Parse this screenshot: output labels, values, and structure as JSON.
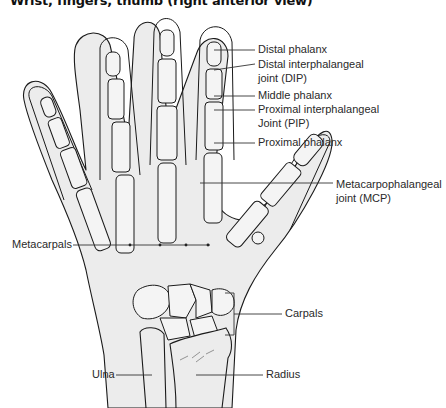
{
  "title": "Wrist, fingers, thumb (right anterior view)",
  "colors": {
    "background": "#ffffff",
    "skin_fill": "#ececec",
    "bone_fill": "#f4f4f4",
    "outline": "#1a1a1a",
    "leader_line": "#333333",
    "text": "#2a2a2a"
  },
  "labels": {
    "distal_phalanx": "Distal phalanx",
    "dip_line1": "Distal interphalangeal",
    "dip_line2": "joint (DIP)",
    "middle_phalanx": "Middle phalanx",
    "pip_line1": "Proximal interphalangeal",
    "pip_line2": "Joint (PIP)",
    "proximal_phalanx": "Proximal phalanx",
    "mcp_line1": "Metacarpophalangeal",
    "mcp_line2": "joint (MCP)",
    "metacarpals": "Metacarpals",
    "carpals": "Carpals",
    "ulna": "Ulna",
    "radius": "Radius"
  }
}
